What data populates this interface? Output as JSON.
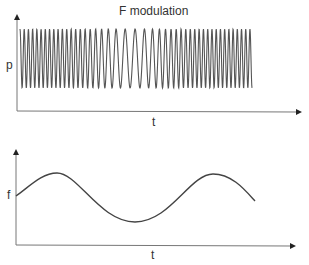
{
  "title": "F modulation",
  "top_chart": {
    "ylabel": "p",
    "xlabel": "t",
    "description": "Frequency-modulated carrier wave: dense oscillations, spreading wider in the middle, then dense again"
  },
  "bottom_chart": {
    "ylabel": "f",
    "xlabel": "t",
    "description": "Modulating signal: frequency varies sinusoidally over time"
  },
  "colors": {
    "line": "#555555",
    "axis": "#777777"
  }
}
